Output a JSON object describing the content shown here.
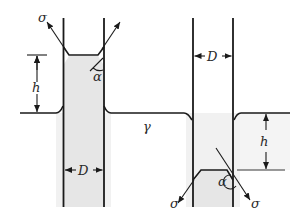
{
  "figure": {
    "labels": {
      "sigma": "σ",
      "alpha": "α",
      "height": "h",
      "diameter": "D",
      "gamma": "γ"
    },
    "left_tube": {
      "description": "capillary rise (wetting liquid)",
      "sigma_label": "σ",
      "alpha_label": "α",
      "h_label": "h",
      "d_label": "D"
    },
    "right_tube": {
      "description": "capillary depression (non-wetting liquid)",
      "sigma_left_label": "σ",
      "sigma_right_label": "σ",
      "alpha_label": "α",
      "h_label": "h",
      "d_label": "D"
    },
    "liquid_label": "γ",
    "colors": {
      "line": "#1a1a1a",
      "liquid_fill": "#e6e6e6",
      "shade_band": "#f1f1f1",
      "thin_line": "#777777"
    }
  }
}
